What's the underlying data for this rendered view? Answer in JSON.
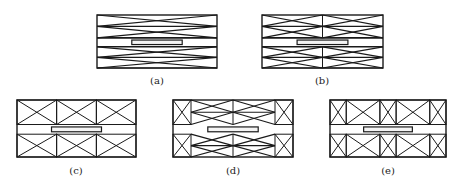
{
  "colors": {
    "stroke": "#1a1a1a",
    "background": "#ffffff",
    "slot_fill": "#f4f4f4"
  },
  "panels": [
    {
      "id": "a",
      "label": "(a)",
      "x0": 97,
      "x1": 217,
      "y0": 15,
      "y1": 68,
      "type": "flat-x-bands",
      "columns": 1
    },
    {
      "id": "b",
      "label": "(b)",
      "x0": 262,
      "x1": 383,
      "y0": 15,
      "y1": 68,
      "type": "flat-x-bands",
      "columns": 2
    },
    {
      "id": "c",
      "label": "(c)",
      "x0": 17,
      "x1": 136,
      "y0": 100,
      "y1": 157,
      "type": "x-cells",
      "cols": [
        0,
        0.333,
        0.667,
        1
      ]
    },
    {
      "id": "d",
      "label": "(d)",
      "x0": 173,
      "x1": 293,
      "y0": 100,
      "y1": 157,
      "type": "mixed",
      "cols": [
        0,
        0.15,
        0.5,
        0.85,
        1
      ]
    },
    {
      "id": "e",
      "label": "(e)",
      "x0": 330,
      "x1": 446,
      "y0": 100,
      "y1": 157,
      "type": "x-cells",
      "cols": [
        0,
        0.14,
        0.43,
        0.57,
        0.86,
        1
      ]
    }
  ]
}
